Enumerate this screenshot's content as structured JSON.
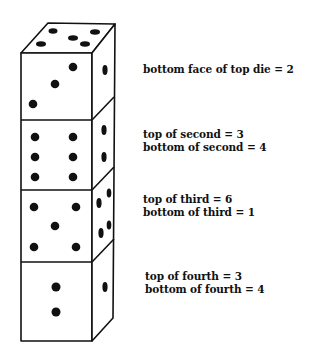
{
  "figure": {
    "ink_color": "#111111",
    "background": "#ffffff"
  },
  "dice": [
    {
      "name": "top die",
      "visible_top": 4,
      "visible_front": 3,
      "visible_side": 1
    },
    {
      "name": "second die",
      "visible_front": 6,
      "visible_side": 2
    },
    {
      "name": "third die",
      "visible_front": 5,
      "visible_side": 4
    },
    {
      "name": "fourth die",
      "visible_front": 2,
      "visible_side": 1
    }
  ],
  "labels": {
    "die1": {
      "line1": "bottom face of top die = 2"
    },
    "die2": {
      "line1": "top of second = 3",
      "line2": "bottom of second = 4"
    },
    "die3": {
      "line1": "top of third = 6",
      "line2": "bottom of third = 1"
    },
    "die4": {
      "line1": "top of fourth = 3",
      "line2": "bottom of fourth = 4"
    }
  }
}
